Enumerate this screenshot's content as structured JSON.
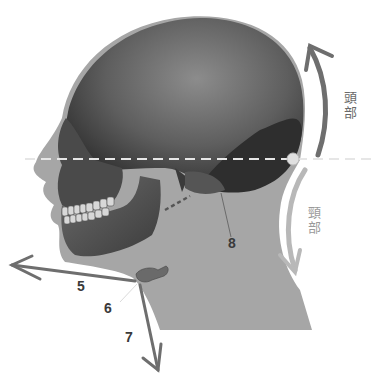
{
  "diagram": {
    "colors": {
      "background": "#ffffff",
      "silhouette": "#a6a6a6",
      "skull_dark": "#2e2e2e",
      "skull_mid": "#5a5a5a",
      "skull_light": "#8a8a8a",
      "arrow_dark": "#6e6e6e",
      "arrow_light": "#b8b8b8",
      "dashed_line": "#e6e6e6",
      "label_dark": "#3a3a3a",
      "label_head": "#6a6a6a",
      "label_neck": "#9a9a9a"
    },
    "labels": {
      "head": {
        "char1": "頭",
        "char2": "部"
      },
      "neck": {
        "char1": "頸",
        "char2": "部"
      }
    },
    "numbers": {
      "n5": "5",
      "n6": "6",
      "n7": "7",
      "n8": "8"
    }
  }
}
